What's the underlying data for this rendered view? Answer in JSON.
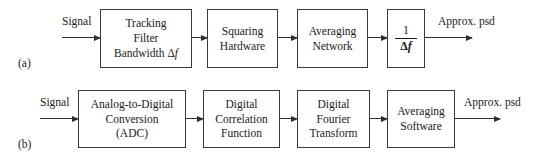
{
  "figure": {
    "background_color": "#ffffff",
    "stroke_color": "#3a3a3a",
    "text_color": "#1a1a1a"
  },
  "rows": [
    {
      "label": "(a)",
      "input_label": "Signal",
      "output_label": "Approx. psd",
      "blocks": [
        {
          "name": "tracking-filter",
          "lines": [
            "Tracking",
            "Filter",
            "Bandwidth Δf"
          ]
        },
        {
          "name": "squaring-hardware",
          "lines": [
            "Squaring",
            "Hardware"
          ]
        },
        {
          "name": "averaging-network",
          "lines": [
            "Averaging",
            "Network"
          ]
        },
        {
          "name": "inverse-bandwidth",
          "lines": [
            "1",
            "Δf"
          ],
          "numerator": "1",
          "denominator": "Δf"
        }
      ]
    },
    {
      "label": "(b)",
      "input_label": "Signal",
      "output_label": "Approx. psd",
      "blocks": [
        {
          "name": "analog-to-digital-conversion",
          "lines": [
            "Analog-to-Digital",
            "Conversion",
            "(ADC)"
          ]
        },
        {
          "name": "digital-correlation-function",
          "lines": [
            "Digital",
            "Correlation",
            "Function"
          ]
        },
        {
          "name": "digital-fourier-transform",
          "lines": [
            "Digital",
            "Fourier",
            "Transform"
          ]
        },
        {
          "name": "averaging-software",
          "lines": [
            "Averaging",
            "Software"
          ]
        }
      ]
    }
  ],
  "symbols": {
    "delta": "Δ",
    "f_italic": "f",
    "one": "1"
  }
}
